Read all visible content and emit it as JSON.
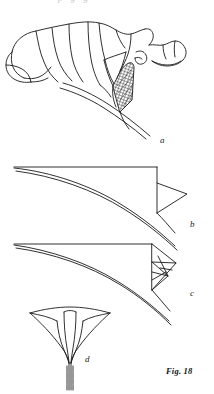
{
  "figure": {
    "caption": "Fig. 18",
    "background_color": "#ffffff",
    "ink_color": "#1a1a1a",
    "top_bleed_text": "p g g"
  },
  "panels": [
    {
      "id": "a",
      "label": "a",
      "name": "flower-profile-open-corolla",
      "description": "Funnel-shaped flower in side view with pleated spreading corolla lobes, hatched calyx and curved pedicel"
    },
    {
      "id": "b",
      "label": "b",
      "name": "corolla-outline-with-wedge",
      "description": "Curved corolla tube profile outline with straight upper margin and triangular wedge at the throat"
    },
    {
      "id": "c",
      "label": "c",
      "name": "corolla-outline-with-folded-wedge",
      "description": "Curved corolla tube profile outline with folded kite-shaped wedge at the throat"
    },
    {
      "id": "d",
      "label": "d",
      "name": "flower-front-view-funnel",
      "description": "Trumpet-shaped flower viewed head on with flared limb and slender stalk"
    }
  ]
}
